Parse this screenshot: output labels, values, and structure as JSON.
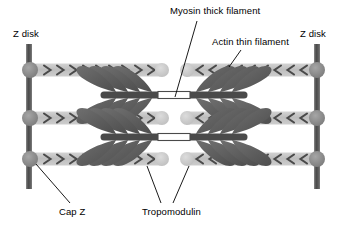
{
  "figure": {
    "width": 351,
    "height": 232,
    "background": "#ffffff"
  },
  "labels": {
    "myosin_thick_filament": "Myosin thick filament",
    "actin_thin_filament": "Actin thin filament",
    "z_disk_left": "Z disk",
    "z_disk_right": "Z disk",
    "cap_z": "Cap Z",
    "tropomodulin": "Tropomodulin"
  },
  "colors": {
    "z_disk": "#6d6d6d",
    "z_disk_dark": "#4f4f4f",
    "cap_z": "#8c8c8c",
    "actin_band": "#c4c4c4",
    "actin_chevron": "#4a4a4a",
    "tropomodulin": "#c9c9c9",
    "myosin_head": "#5e5e5e",
    "myosin_backbone": "#4a4a4a",
    "myosin_bare_zone": "#ffffff",
    "leader_line": "#000000",
    "text": "#000000"
  },
  "structures": {
    "z_disks": [
      {
        "name": "z-disk-left",
        "x": 28,
        "top": 44,
        "bottom": 188,
        "width": 5
      },
      {
        "name": "z-disk-right",
        "x": 315,
        "top": 44,
        "bottom": 188,
        "width": 5
      }
    ],
    "cap_z_nodes": [
      {
        "side": "left",
        "x": 30,
        "y": 70
      },
      {
        "side": "left",
        "x": 30,
        "y": 118
      },
      {
        "side": "left",
        "x": 30,
        "y": 159
      },
      {
        "side": "right",
        "x": 317,
        "y": 70
      },
      {
        "side": "right",
        "x": 317,
        "y": 118
      },
      {
        "side": "right",
        "x": 317,
        "y": 159
      }
    ],
    "actin_filaments": [
      {
        "row": 1,
        "side": "left",
        "x1": 30,
        "x2": 161,
        "y": 70,
        "direction": "right",
        "chevrons": 9
      },
      {
        "row": 1,
        "side": "right",
        "x1": 186,
        "x2": 317,
        "y": 70,
        "direction": "left",
        "chevrons": 9
      },
      {
        "row": 2,
        "side": "left",
        "x1": 30,
        "x2": 161,
        "y": 118,
        "direction": "right",
        "chevrons": 9
      },
      {
        "row": 2,
        "side": "right",
        "x1": 186,
        "x2": 317,
        "y": 118,
        "direction": "left",
        "chevrons": 9
      },
      {
        "row": 3,
        "side": "left",
        "x1": 30,
        "x2": 161,
        "y": 159,
        "direction": "right",
        "chevrons": 9
      },
      {
        "row": 3,
        "side": "right",
        "x1": 186,
        "x2": 317,
        "y": 159,
        "direction": "left",
        "chevrons": 9
      }
    ],
    "tropomodulin_nodes": [
      {
        "x": 162,
        "y": 70
      },
      {
        "x": 186,
        "y": 70
      },
      {
        "x": 162,
        "y": 118
      },
      {
        "x": 186,
        "y": 118
      },
      {
        "x": 162,
        "y": 159
      },
      {
        "x": 186,
        "y": 159
      }
    ],
    "myosin_filaments": [
      {
        "index": 1,
        "y": 95,
        "x1": 100,
        "x2": 248,
        "bare_zone_x1": 160,
        "bare_zone_x2": 188,
        "head_pairs": 8
      },
      {
        "index": 2,
        "y": 137,
        "x1": 100,
        "x2": 248,
        "bare_zone_x1": 160,
        "bare_zone_x2": 188,
        "head_pairs": 8
      }
    ],
    "leader_lines": [
      {
        "name": "myosin-leader",
        "x1": 196,
        "y1": 22,
        "x2": 174,
        "y2": 96
      },
      {
        "name": "actin-leader",
        "x1": 240,
        "y1": 50,
        "x2": 228,
        "y2": 66
      },
      {
        "name": "capz-leader",
        "x1": 70,
        "y1": 204,
        "x2": 34,
        "y2": 163
      },
      {
        "name": "tropomodulin-leader-1",
        "x1": 160,
        "y1": 204,
        "x2": 146,
        "y2": 166
      },
      {
        "name": "tropomodulin-leader-2",
        "x1": 172,
        "y1": 204,
        "x2": 188,
        "y2": 166
      }
    ]
  }
}
